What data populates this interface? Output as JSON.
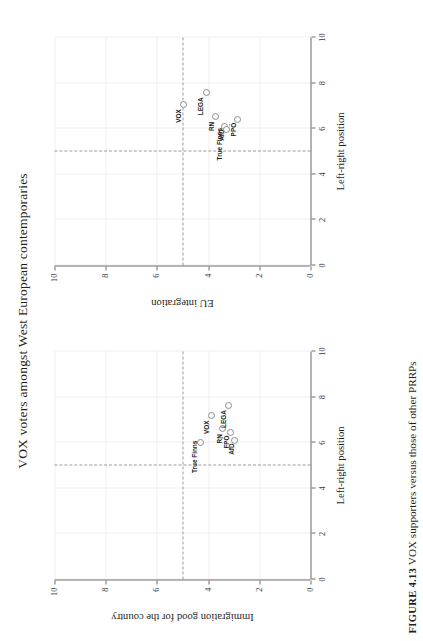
{
  "figure": {
    "title": "VOX voters amongst West European contemporaries",
    "caption_number": "FIGURE 4.13",
    "caption_text": "VOX supporters versus those of other PRRPs"
  },
  "chart_data": [
    {
      "id": "left-panel",
      "type": "scatter",
      "title": "",
      "xlabel": "Left-right position",
      "ylabel": "Immigration good for the country",
      "xlim": [
        0,
        10
      ],
      "ylim": [
        0,
        10
      ],
      "xticks": [
        "0",
        "2",
        "4",
        "6",
        "8",
        "10"
      ],
      "yticks": [
        "0",
        "2",
        "4",
        "6",
        "8",
        "10"
      ],
      "grid": true,
      "reference_lines": {
        "vertical_x": 5,
        "horizontal_y": 5
      },
      "points": [
        {
          "label": "True Finns",
          "x": 6.0,
          "y": 4.3,
          "label_dx": -0.62,
          "label_dy": 0.22
        },
        {
          "label": "VOX",
          "x": 7.2,
          "y": 3.88,
          "label_dx": -0.52,
          "label_dy": 0.18
        },
        {
          "label": "RN",
          "x": 6.62,
          "y": 3.42,
          "label_dx": -0.45,
          "label_dy": 0.12
        },
        {
          "label": "LEGA",
          "x": 7.62,
          "y": 3.2,
          "label_dx": -0.58,
          "label_dy": 0.18
        },
        {
          "label": "FPÖ",
          "x": 6.45,
          "y": 3.14,
          "label_dx": -0.42,
          "label_dy": 0.14
        },
        {
          "label": "AfD",
          "x": 6.1,
          "y": 2.98,
          "label_dx": -0.38,
          "label_dy": 0.12
        }
      ]
    },
    {
      "id": "right-panel",
      "type": "scatter",
      "title": "",
      "xlabel": "Left-right position",
      "ylabel": "EU integration",
      "xlim": [
        0,
        10
      ],
      "ylim": [
        0,
        10
      ],
      "xticks": [
        "0",
        "2",
        "4",
        "6",
        "8",
        "10"
      ],
      "yticks": [
        "0",
        "2",
        "4",
        "6",
        "8",
        "10"
      ],
      "grid": true,
      "reference_lines": {
        "vertical_x": 5,
        "horizontal_y": 5
      },
      "points": [
        {
          "label": "VOX",
          "x": 7.08,
          "y": 4.98,
          "label_dx": -0.52,
          "label_dy": 0.18
        },
        {
          "label": "LEGA",
          "x": 7.58,
          "y": 4.08,
          "label_dx": -0.6,
          "label_dy": 0.2
        },
        {
          "label": "RN",
          "x": 6.55,
          "y": 3.72,
          "label_dx": -0.45,
          "label_dy": 0.14
        },
        {
          "label": "AfD",
          "x": 6.08,
          "y": 3.36,
          "label_dx": -0.36,
          "label_dy": 0.12
        },
        {
          "label": "True Finns",
          "x": 5.98,
          "y": 3.3,
          "label_dx": -0.66,
          "label_dy": 0.26
        },
        {
          "label": "PPÖ",
          "x": 6.42,
          "y": 2.86,
          "label_dx": -0.46,
          "label_dy": 0.16
        }
      ]
    }
  ]
}
